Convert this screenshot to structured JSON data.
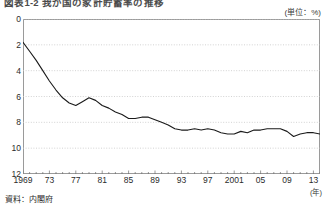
{
  "title": "図表1-2 我が国の家計貯蓄率の推移",
  "unit_label": "(単位：%)",
  "x_unit_label": "(年)",
  "source_note": "資料：内閣府",
  "axis": {
    "y_ticks": [
      "12",
      "10",
      "8",
      "6",
      "4",
      "2",
      "0"
    ],
    "x_ticks": [
      "1969",
      "73",
      "77",
      "81",
      "85",
      "89",
      "93",
      "97",
      "2001",
      "05",
      "09",
      "13"
    ]
  },
  "colors": {
    "line": "#1a1a1a",
    "frame": "#9a9a9a",
    "gridline": "#c8c8c8",
    "text": "#2b2b2b",
    "background": "#ffffff"
  },
  "chart_data": {
    "type": "line",
    "title": "図表1-2 我が国の家計貯蓄率の推移",
    "xlabel": "(年)",
    "ylabel": "(単位：%)",
    "xlim": [
      1969,
      2014
    ],
    "ylim": [
      0,
      12
    ],
    "yticks": [
      0,
      2,
      4,
      6,
      8,
      10,
      12
    ],
    "xticks": [
      1969,
      1973,
      1977,
      1981,
      1985,
      1989,
      1993,
      1997,
      2001,
      2005,
      2009,
      2013
    ],
    "grid": true,
    "grid_axis": "y",
    "legend": false,
    "series": [
      {
        "name": "家計貯蓄率",
        "x": [
          1969,
          1970,
          1971,
          1972,
          1973,
          1974,
          1975,
          1976,
          1977,
          1978,
          1979,
          1980,
          1981,
          1982,
          1983,
          1984,
          1985,
          1986,
          1987,
          1988,
          1989,
          1990,
          1991,
          1992,
          1993,
          1994,
          1995,
          1996,
          1997,
          1998,
          1999,
          2000,
          2001,
          2002,
          2003,
          2004,
          2005,
          2006,
          2007,
          2008,
          2009,
          2010,
          2011,
          2012,
          2013,
          2014
        ],
        "values": [
          10.2,
          9.5,
          8.8,
          8.0,
          7.2,
          6.5,
          5.9,
          5.5,
          5.3,
          5.6,
          5.9,
          5.7,
          5.3,
          5.1,
          4.8,
          4.6,
          4.3,
          4.3,
          4.4,
          4.4,
          4.2,
          4.0,
          3.8,
          3.5,
          3.4,
          3.4,
          3.5,
          3.4,
          3.5,
          3.4,
          3.2,
          3.1,
          3.1,
          3.3,
          3.2,
          3.4,
          3.4,
          3.5,
          3.5,
          3.5,
          3.3,
          2.9,
          3.1,
          3.2,
          3.2,
          3.1
        ]
      }
    ]
  }
}
